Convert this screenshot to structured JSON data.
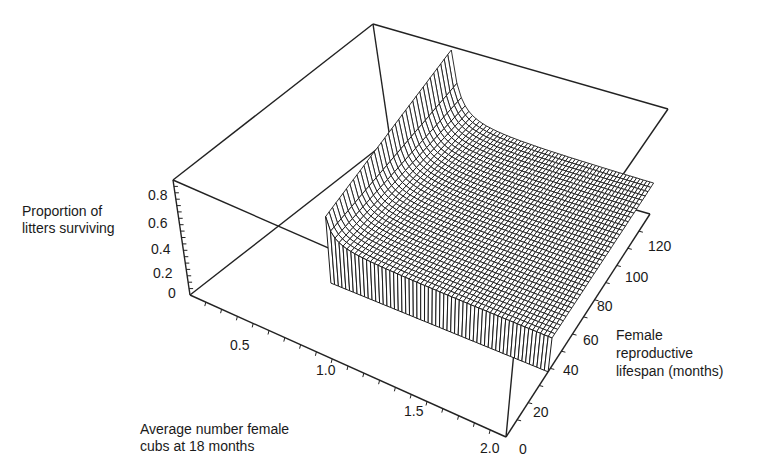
{
  "chart_data": {
    "type": "surface3d",
    "title": "",
    "z_axis": {
      "label_lines": [
        "Proportion of",
        "litters surviving"
      ],
      "ticks": [
        "0.8",
        "0.6",
        "0.4",
        "0.2",
        "0"
      ],
      "range": [
        0,
        0.9
      ]
    },
    "x_axis": {
      "label_lines": [
        "Average number female",
        "cubs at 18 months"
      ],
      "ticks": [
        "0.5",
        "1.0",
        "1.5",
        "2.0"
      ],
      "range": [
        0,
        2.0
      ]
    },
    "y_axis": {
      "label_lines": [
        "Female",
        "reproductive",
        "lifespan (months)"
      ],
      "ticks": [
        "0",
        "20",
        "40",
        "60",
        "80",
        "100",
        "120"
      ],
      "range": [
        0,
        130
      ]
    },
    "surface": {
      "description": "Proportion of litters surviving rises steeply (to ~0.9) as average female cubs approaches ~0.55 and longer lifespans; flattens to a plateau for higher cub numbers; drops to 0 for short lifespans (< ~40 months)",
      "x_min_defined": 0.55,
      "plateau_value": 0.28,
      "peak_value": 0.9,
      "lifespan_threshold": 38
    },
    "grid": false,
    "box": true
  },
  "labels": {
    "z": [
      "Proportion of",
      "litters surviving"
    ],
    "x": [
      "Average number female",
      "cubs at 18 months"
    ],
    "y": [
      "Female",
      "reproductive",
      "lifespan (months)"
    ]
  },
  "ticks": {
    "z": [
      "0.8",
      "0.6",
      "0.4",
      "0.2",
      "0"
    ],
    "x": [
      "0.5",
      "1.0",
      "1.5",
      "2.0"
    ],
    "y": [
      "0",
      "20",
      "40",
      "60",
      "80",
      "100",
      "120"
    ]
  }
}
